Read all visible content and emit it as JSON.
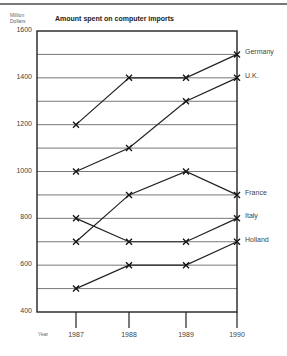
{
  "chart_data": {
    "type": "line",
    "title": "Amount spent on computer imports",
    "ylabel": "Million Dollars",
    "xlabel": "Year",
    "categories": [
      "1987",
      "1988",
      "1989",
      "1990"
    ],
    "ylim": [
      400,
      1600
    ],
    "yticks": [
      "1600",
      "1400",
      "1200",
      "1000",
      "800",
      "600",
      "400"
    ],
    "grid": true,
    "legend_position": "right, inline at line ends",
    "series": [
      {
        "name": "Germany",
        "values": [
          1200,
          1400,
          1400,
          1500
        ]
      },
      {
        "name": "U.K.",
        "values": [
          1000,
          1100,
          1300,
          1400
        ]
      },
      {
        "name": "France",
        "values": [
          700,
          900,
          1000,
          900
        ]
      },
      {
        "name": "Italy",
        "values": [
          800,
          700,
          700,
          800
        ]
      },
      {
        "name": "Holland",
        "values": [
          500,
          600,
          600,
          700
        ]
      }
    ]
  },
  "labels": {
    "unit_line1": "Million",
    "unit_line2": "Dollars",
    "year": "Year"
  }
}
